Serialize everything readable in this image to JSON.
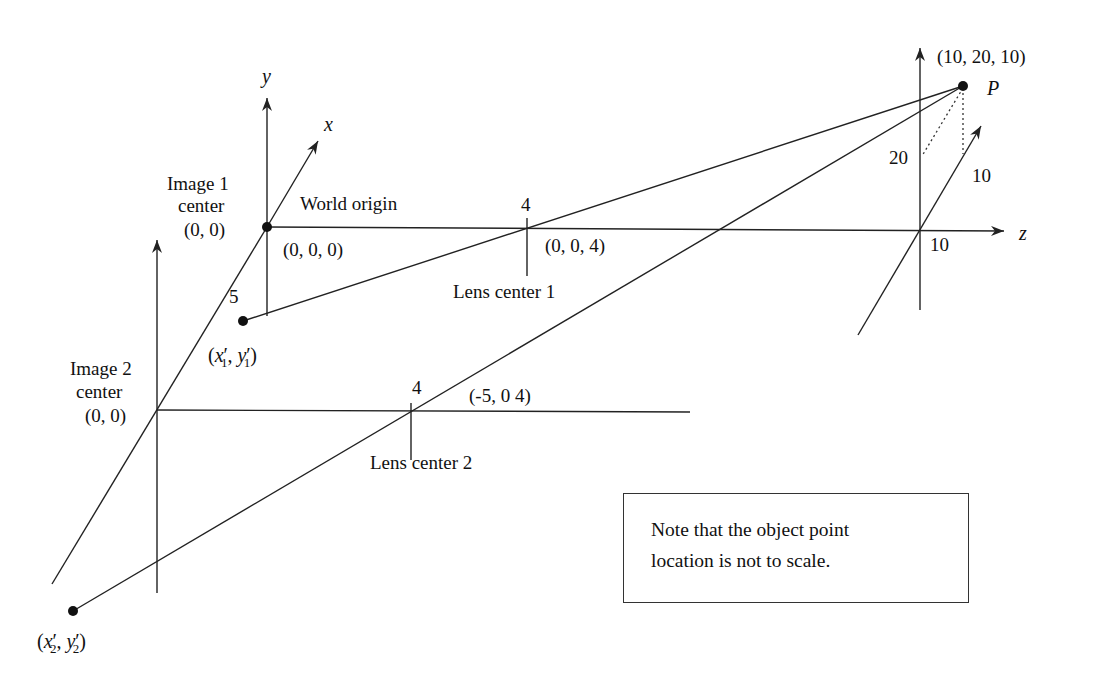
{
  "diagram": {
    "axes": {
      "x_label": "x",
      "y_label": "y",
      "z_label": "z"
    },
    "world_origin": {
      "label": "World origin",
      "coords": "(0, 0, 0)"
    },
    "image1_center": {
      "line1": "Image 1",
      "line2": "center",
      "coords": "(0, 0)"
    },
    "image2_center": {
      "line1": "Image 2",
      "line2": "center",
      "coords": "(0, 0)"
    },
    "lens1": {
      "tick_label": "4",
      "coords": "(0, 0, 4)",
      "label": "Lens center 1"
    },
    "lens2": {
      "tick_label": "4",
      "coords": "(-5, 0 4)",
      "label": "Lens center 2"
    },
    "baseline_label": "5",
    "image_point_1": {
      "open": "(",
      "x": "x",
      "y": "y",
      "prime": "′",
      "sub": "1",
      "sep": ", ",
      "close": ")"
    },
    "image_point_2": {
      "open": "(",
      "x": "x",
      "y": "y",
      "prime": "′",
      "sub": "2",
      "sep": ", ",
      "close": ")"
    },
    "object_point": {
      "name": "P",
      "coords": "(10, 20, 10)",
      "y_value": "20",
      "x_value": "10",
      "z_value": "10"
    },
    "note": {
      "line1": "Note that the object point",
      "line2": "location is not to scale."
    }
  }
}
